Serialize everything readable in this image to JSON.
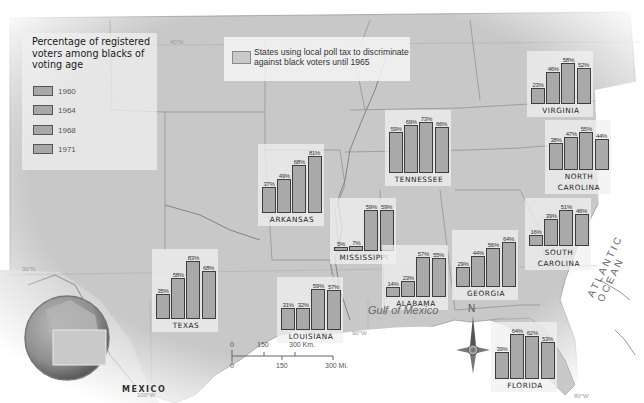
{
  "legend": {
    "title": "Percentage of registered voters among blacks of voting age",
    "items": [
      {
        "year": "1960"
      },
      {
        "year": "1964"
      },
      {
        "year": "1968"
      },
      {
        "year": "1971"
      }
    ]
  },
  "poll_tax_note": {
    "label": "States using local poll tax to discriminate against black voters until 1965"
  },
  "geo_labels": {
    "gulf": "Gulf of Mexico",
    "ocean": "ATLANTIC OCEAN",
    "mexico": "MEXICO",
    "north": "N",
    "lat40": "40°N",
    "lat30": "30°N",
    "lon100": "100°W",
    "lon90": "90°W",
    "lon80": "80°W"
  },
  "scale_bar": {
    "km_labels": [
      "0",
      "150",
      "300 Km."
    ],
    "mi_labels": [
      "0",
      "150",
      "300 Mi."
    ]
  },
  "chart_data": {
    "type": "bar",
    "title": "Percentage of registered voters among blacks of voting age",
    "categories": [
      "1960",
      "1964",
      "1968",
      "1971"
    ],
    "ylabel": "Percent registered",
    "ylim": [
      0,
      100
    ],
    "states": [
      {
        "name": "VIRGINIA",
        "values": [
          23,
          46,
          58,
          52
        ],
        "labels": [
          "23%",
          "46%",
          "58%",
          "52%"
        ]
      },
      {
        "name": "TENNESSEE",
        "values": [
          59,
          69,
          73,
          66
        ],
        "labels": [
          "59%",
          "69%",
          "73%",
          "66%"
        ]
      },
      {
        "name": "NORTH CAROLINA",
        "values": [
          38,
          47,
          55,
          44
        ],
        "labels": [
          "38%",
          "47%",
          "55%",
          "44%"
        ]
      },
      {
        "name": "ARKANSAS",
        "values": [
          37,
          49,
          68,
          81
        ],
        "labels": [
          "37%",
          "49%",
          "68%",
          "81%"
        ]
      },
      {
        "name": "MISSISSIPPI",
        "values": [
          5,
          7,
          59,
          59
        ],
        "labels": [
          "5%",
          "7%",
          "59%",
          "59%"
        ]
      },
      {
        "name": "SOUTH CAROLINA",
        "values": [
          16,
          39,
          51,
          46
        ],
        "labels": [
          "16%",
          "39%",
          "51%",
          "46%"
        ]
      },
      {
        "name": "TEXAS",
        "values": [
          35,
          58,
          83,
          68
        ],
        "labels": [
          "35%",
          "58%",
          "83%",
          "68%"
        ]
      },
      {
        "name": "GEORGIA",
        "values": [
          29,
          44,
          56,
          64
        ],
        "labels": [
          "29%",
          "44%",
          "56%",
          "64%"
        ]
      },
      {
        "name": "ALABAMA",
        "values": [
          14,
          23,
          57,
          55
        ],
        "labels": [
          "14%",
          "23%",
          "57%",
          "55%"
        ]
      },
      {
        "name": "LOUISIANA",
        "values": [
          31,
          32,
          59,
          57
        ],
        "labels": [
          "31%",
          "32%",
          "59%",
          "57%"
        ]
      },
      {
        "name": "FLORIDA",
        "values": [
          39,
          64,
          62,
          53
        ],
        "labels": [
          "39%",
          "64%",
          "62%",
          "53%"
        ]
      }
    ]
  },
  "charts": [
    {
      "id": "va",
      "name": "VIRGINIA",
      "label_lines": [
        "VIRGINIA"
      ],
      "x": 531,
      "base": 104,
      "vals": [
        23,
        46,
        58,
        52
      ],
      "lbls": [
        "23%",
        "46%",
        "58%",
        "52%"
      ]
    },
    {
      "id": "tn",
      "name": "TENNESSEE",
      "label_lines": [
        "TENNESSEE"
      ],
      "x": 389,
      "base": 173,
      "vals": [
        59,
        69,
        73,
        66
      ],
      "lbls": [
        "59%",
        "69%",
        "73%",
        "66%"
      ]
    },
    {
      "id": "nc",
      "name": "NORTH CAROLINA",
      "label_lines": [
        "NORTH",
        "CAROLINA"
      ],
      "x": 549,
      "base": 170,
      "vals": [
        38,
        47,
        55,
        44
      ],
      "lbls": [
        "38%",
        "47%",
        "55%",
        "44%"
      ]
    },
    {
      "id": "ar",
      "name": "ARKANSAS",
      "label_lines": [
        "ARKANSAS"
      ],
      "x": 262,
      "base": 213,
      "vals": [
        37,
        49,
        68,
        81
      ],
      "lbls": [
        "37%",
        "49%",
        "68%",
        "81%"
      ]
    },
    {
      "id": "ms",
      "name": "MISSISSIPPI",
      "label_lines": [
        "MISSISSIPPI"
      ],
      "x": 334,
      "base": 251,
      "vals": [
        5,
        7,
        59,
        59
      ],
      "lbls": [
        "5%",
        "7%",
        "59%",
        "59%"
      ]
    },
    {
      "id": "sc",
      "name": "SOUTH CAROLINA",
      "label_lines": [
        "SOUTH",
        "CAROLINA"
      ],
      "x": 529,
      "base": 246,
      "vals": [
        16,
        39,
        51,
        46
      ],
      "lbls": [
        "16%",
        "39%",
        "51%",
        "46%"
      ]
    },
    {
      "id": "tx",
      "name": "TEXAS",
      "label_lines": [
        "TEXAS"
      ],
      "x": 156,
      "base": 319,
      "vals": [
        35,
        58,
        83,
        68
      ],
      "lbls": [
        "35%",
        "58%",
        "83%",
        "68%"
      ]
    },
    {
      "id": "ga",
      "name": "GEORGIA",
      "label_lines": [
        "GEORGIA"
      ],
      "x": 456,
      "base": 287,
      "vals": [
        29,
        44,
        56,
        64
      ],
      "lbls": [
        "29%",
        "44%",
        "56%",
        "64%"
      ]
    },
    {
      "id": "al",
      "name": "ALABAMA",
      "label_lines": [
        "ALABAMA"
      ],
      "x": 386,
      "base": 297,
      "vals": [
        14,
        23,
        57,
        55
      ],
      "lbls": [
        "14%",
        "23%",
        "57%",
        "55%"
      ]
    },
    {
      "id": "la",
      "name": "LOUISIANA",
      "label_lines": [
        "LOUISIANA"
      ],
      "x": 281,
      "base": 330,
      "vals": [
        31,
        32,
        59,
        57
      ],
      "lbls": [
        "31%",
        "32%",
        "59%",
        "57%"
      ]
    },
    {
      "id": "fl",
      "name": "FLORIDA",
      "label_lines": [
        "FLORIDA"
      ],
      "x": 495,
      "base": 379,
      "vals": [
        39,
        64,
        62,
        53
      ],
      "lbls": [
        "39%",
        "64%",
        "62%",
        "53%"
      ]
    }
  ]
}
